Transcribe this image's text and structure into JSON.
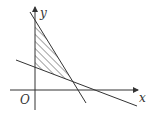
{
  "diagram": {
    "type": "linear-programming-feasible-region",
    "axes": {
      "x_label": "x",
      "y_label": "y",
      "origin_label": "O"
    },
    "lines": [
      {
        "name": "steep-line",
        "description": "decreasing line crossing y-axis high and x-axis right of origin"
      },
      {
        "name": "shallow-line",
        "description": "gently decreasing line crossing y-axis low and x-axis far right"
      }
    ],
    "shaded_region": "triangle bounded by y-axis, steep line and shallow line",
    "colors": {
      "stroke": "#333333",
      "background": "#ffffff"
    }
  }
}
